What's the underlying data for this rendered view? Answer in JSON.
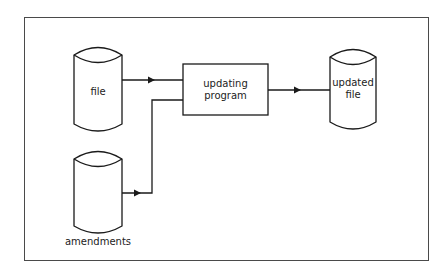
{
  "diagram": {
    "type": "flowchart",
    "nodes": {
      "file": {
        "shape": "cylinder",
        "label": "file"
      },
      "amendments": {
        "shape": "cylinder",
        "label": "amendments"
      },
      "program": {
        "shape": "rectangle",
        "label_line1": "updating",
        "label_line2": "program"
      },
      "updated_file": {
        "shape": "cylinder",
        "label_line1": "updated",
        "label_line2": "file"
      }
    },
    "edges": [
      {
        "from": "file",
        "to": "program"
      },
      {
        "from": "amendments",
        "to": "program"
      },
      {
        "from": "program",
        "to": "updated_file"
      }
    ],
    "colors": {
      "line": "#1a1a1a",
      "frame": "#4a4a4a",
      "background": "#ffffff"
    }
  }
}
